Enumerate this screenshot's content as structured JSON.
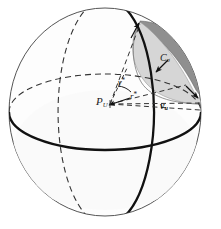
{
  "figure": {
    "canvas": {
      "width": 221,
      "height": 229,
      "background": "#ffffff"
    },
    "sphere": {
      "center_x": 105,
      "center_y": 112,
      "radius_x": 96,
      "radius_y": 104,
      "outline_color": "#555555",
      "fill_color": "#fdfdfd"
    },
    "colors": {
      "outline": "#555555",
      "heavy_line": "#111111",
      "dashed_line": "#333333",
      "cap_light": "#d3d3d3",
      "cap_dark": "#8c8c8c",
      "label_text": "#1a1a1a"
    },
    "labels": {
      "center_point": {
        "base": "P",
        "sub": "U",
        "text": "P_U"
      },
      "angle": {
        "base": "γ",
        "sup": "*",
        "text": "γ*"
      },
      "radius": {
        "base": "r",
        "sup": "*",
        "text": "r*"
      },
      "vector": {
        "base": "v",
        "sub": "u",
        "text": "v_u"
      },
      "cap": {
        "base": "C",
        "sub": "σ",
        "text": "C_σ"
      }
    },
    "elements": {
      "equator_front": "solid-thick-ellipse-front",
      "equator_back": "dashed-ellipse-back",
      "meridian_front": "solid-thick-vertical-ellipse",
      "meridian_back": "dashed-vertical-ellipse",
      "cap_region": "shaded-lune-upper-right",
      "arrow_to_center": "arrowhead-at-P_U",
      "arrow_to_cap_top": "arrowhead-at-cap-top",
      "arrow_to_cap_bottom": "arrowhead-at-cap-bottom",
      "arrow_cap_label": "arrowhead-under-C-sigma"
    }
  }
}
